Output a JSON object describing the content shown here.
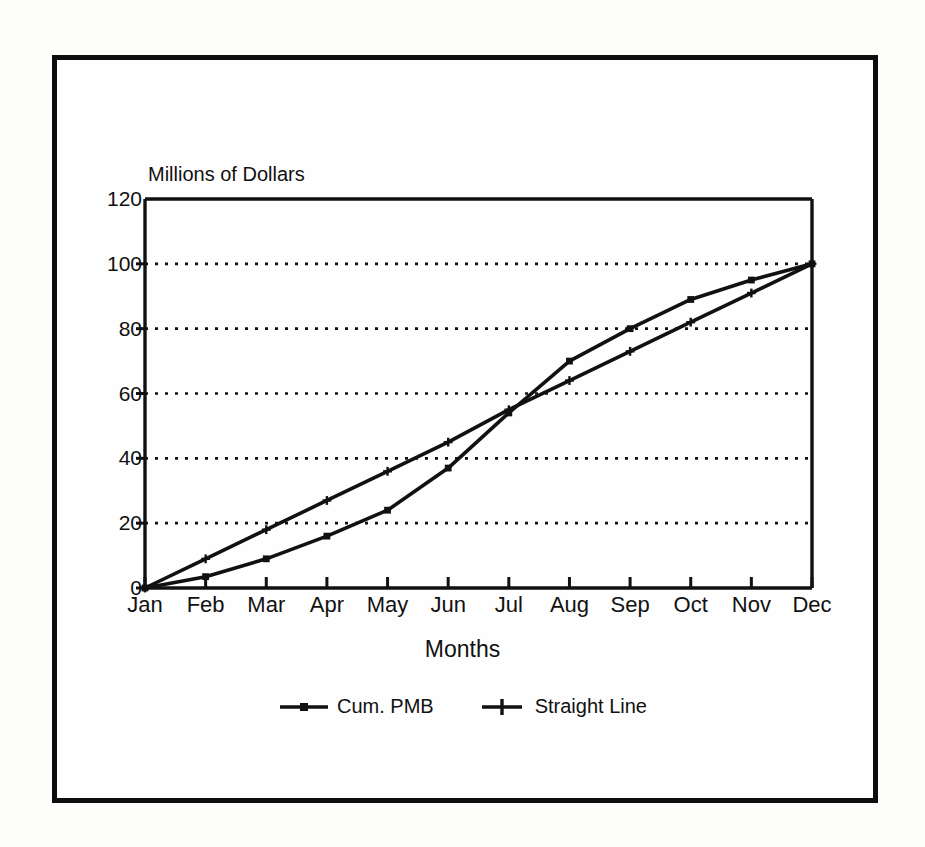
{
  "chart_data": {
    "type": "line",
    "title": "",
    "ylabel": "Millions of Dollars",
    "xlabel": "Months",
    "categories": [
      "Jan",
      "Feb",
      "Mar",
      "Apr",
      "May",
      "Jun",
      "Jul",
      "Aug",
      "Sep",
      "Oct",
      "Nov",
      "Dec"
    ],
    "ylim": [
      0,
      120
    ],
    "yticks": [
      0,
      20,
      40,
      60,
      80,
      100,
      120
    ],
    "grid": "horizontal-dotted",
    "legend_position": "bottom-center",
    "series": [
      {
        "name": "Cum. PMB",
        "marker": "square",
        "values": [
          0,
          3.5,
          9,
          16,
          24,
          37,
          54,
          70,
          80,
          89,
          95,
          100
        ]
      },
      {
        "name": "Straight Line",
        "marker": "plus",
        "values": [
          0,
          9,
          18,
          27,
          36,
          45,
          55,
          64,
          73,
          82,
          91,
          100
        ]
      }
    ]
  },
  "legend": {
    "items": [
      {
        "label": "Cum. PMB",
        "marker": "square-marker-icon"
      },
      {
        "label": "Straight Line",
        "marker": "plus-marker-icon"
      }
    ]
  },
  "colors": {
    "ink": "#111111",
    "frame": "#0d0d0d",
    "background": "#fefefe"
  }
}
